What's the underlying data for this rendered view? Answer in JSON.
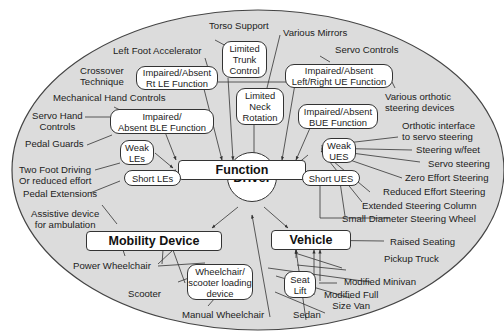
{
  "colors": {
    "ellipse_fill": "#dcdcdc",
    "ellipse_stroke": "#444444",
    "box_fill": "#ffffff",
    "line": "#333333"
  },
  "center": {
    "label": "Driver"
  },
  "hubs": {
    "function": "Function",
    "mobility_device": "Mobility Device",
    "vehicle": "Vehicle"
  },
  "conditions": {
    "limited_trunk": [
      "Limited",
      "Trunk",
      "Control"
    ],
    "limited_neck": [
      "Limited",
      "Neck",
      "Rotation"
    ],
    "rt_le": [
      "Impaired/Absent",
      "Rt LE Function"
    ],
    "ble": [
      "Impaired/",
      "Absent BLE Function"
    ],
    "lr_ue": [
      "Impaired/Absent",
      "Left/Right UE Function"
    ],
    "bue": [
      "Impaired/Absent",
      "BUE Function"
    ],
    "weak_les": [
      "Weak",
      "LEs"
    ],
    "short_les": "Short LEs",
    "weak_ues": [
      "Weak",
      "UES"
    ],
    "short_ues": "Short UES",
    "loading_device": [
      "Wheelchair/",
      "scooter loading",
      "device"
    ],
    "seat_lift": [
      "Seat",
      "Lift"
    ]
  },
  "adaptations": {
    "torso_support": "Torso Support",
    "left_foot_accel": "Left Foot Accelerator",
    "various_mirrors": "Various Mirrors",
    "crossover": [
      "Crossover",
      "Technique"
    ],
    "servo_controls": "Servo Controls",
    "mech_hand": "Mechanical Hand Controls",
    "servo_hand": [
      "Servo Hand",
      "Controls"
    ],
    "various_orthotic": [
      "Various orthotic",
      "steering devices"
    ],
    "pedal_guards": "Pedal Guards",
    "orthotic_interface": [
      "Orthotic interface",
      "to servo steering"
    ],
    "steering_feet": "Steering w/feet",
    "two_foot": [
      "Two Foot Driving",
      "Or reduced effort"
    ],
    "servo_steering": "Servo steering",
    "zero_effort": "Zero Effort Steering",
    "pedal_ext": "Pedal Extensions",
    "reduced_effort": "Reduced Effort Steering",
    "extended_column": "Extended Steering Column",
    "small_wheel": "Small Diameter Steering Wheel",
    "assistive": [
      "Assistive device",
      "for ambulation"
    ],
    "raised_seating": "Raised Seating",
    "pickup": "Pickup Truck",
    "power_wc": "Power Wheelchair",
    "modified_minivan": "Modified Minivan",
    "scooter": "Scooter",
    "modified_van": [
      "Modified Full",
      "Size Van"
    ],
    "manual_wc": "Manual Wheelchair",
    "sedan": "Sedan"
  }
}
